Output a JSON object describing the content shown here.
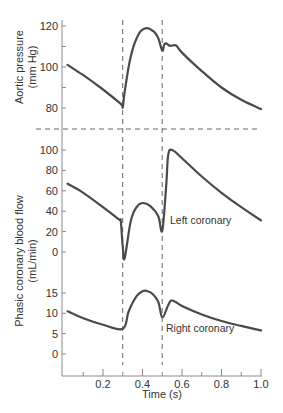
{
  "chart_data": {
    "type": "line",
    "title": "",
    "xlabel": "Time (s)",
    "x_ticks": [
      0.2,
      0.4,
      0.6,
      0.8,
      1.0
    ],
    "x_minor_ticks": [
      0.1,
      0.3,
      0.5,
      0.7,
      0.9
    ],
    "xlim": [
      0.0,
      1.0
    ],
    "grid": false,
    "vertical_markers": [
      0.3,
      0.5
    ],
    "panels": [
      {
        "name": "aortic-pressure",
        "ylabel_line1": "Aortic pressure",
        "ylabel_line2": "(mm Hg)",
        "y_ticks": [
          80,
          100,
          120
        ],
        "y_minor_ticks": [
          90,
          110
        ],
        "ylim": [
          78,
          120
        ],
        "series": [
          {
            "name": "Aortic pressure",
            "x": [
              0.02,
              0.1,
              0.2,
              0.29,
              0.3,
              0.31,
              0.34,
              0.38,
              0.42,
              0.46,
              0.48,
              0.5,
              0.51,
              0.52,
              0.54,
              0.57,
              0.6,
              0.7,
              0.8,
              0.9,
              1.0
            ],
            "values": [
              101,
              96,
              89,
              82,
              80.5,
              88,
              105,
              116,
              119,
              117,
              114,
              108,
              111,
              111.5,
              110.3,
              110.5,
              107,
              98,
              90,
              84,
              79.5
            ]
          }
        ]
      },
      {
        "name": "left-coronary",
        "ylabel_line1": "Phasic coronary blood flow",
        "ylabel_line2": "(mL/min)",
        "y_ticks": [
          0,
          20,
          40,
          60,
          80,
          100
        ],
        "ylim": [
          -5,
          105
        ],
        "annotation": "Left coronary",
        "series": [
          {
            "name": "Left coronary",
            "x": [
              0.02,
              0.1,
              0.2,
              0.28,
              0.29,
              0.3,
              0.31,
              0.34,
              0.37,
              0.4,
              0.44,
              0.48,
              0.5,
              0.52,
              0.53,
              0.55,
              0.6,
              0.7,
              0.8,
              0.9,
              1.0
            ],
            "values": [
              67,
              58,
              44,
              32,
              30,
              5,
              -6,
              30,
              44,
              48,
              45,
              35,
              21,
              65,
              95,
              100,
              92,
              74,
              58,
              44,
              31
            ]
          }
        ]
      },
      {
        "name": "right-coronary",
        "y_ticks": [
          0,
          5,
          10,
          15
        ],
        "ylim": [
          -5,
          17
        ],
        "annotation": "Right coronary",
        "series": [
          {
            "name": "Right coronary",
            "x": [
              0.02,
              0.1,
              0.2,
              0.3,
              0.33,
              0.37,
              0.4,
              0.42,
              0.45,
              0.48,
              0.5,
              0.53,
              0.55,
              0.6,
              0.7,
              0.8,
              0.9,
              1.0
            ],
            "values": [
              10.5,
              8.8,
              7.2,
              6.2,
              10.5,
              14.2,
              15.4,
              15.5,
              14.8,
              12.8,
              9,
              12,
              13.2,
              11.8,
              9.7,
              8.1,
              6.9,
              5.8
            ]
          }
        ]
      }
    ]
  },
  "labels": {
    "aortic_ylabel_1": "Aortic pressure",
    "aortic_ylabel_2": "(mm Hg)",
    "flow_ylabel_1": "Phasic coronary blood flow",
    "flow_ylabel_2": "(mL/min)",
    "left_annotation": "Left coronary",
    "right_annotation": "Right coronary",
    "xlabel": "Time (s)",
    "x_ticks": [
      "0.2",
      "0.4",
      "0.6",
      "0.8",
      "1.0"
    ],
    "aortic_ticks": [
      "120",
      "100",
      "80"
    ],
    "left_ticks": [
      "100",
      "80",
      "60",
      "40",
      "20",
      "0"
    ],
    "right_ticks": [
      "15",
      "10",
      "5",
      "0"
    ]
  },
  "style": {
    "line_color": "#4a4a4a",
    "axis_color": "#888888",
    "dash_color": "#666666"
  }
}
